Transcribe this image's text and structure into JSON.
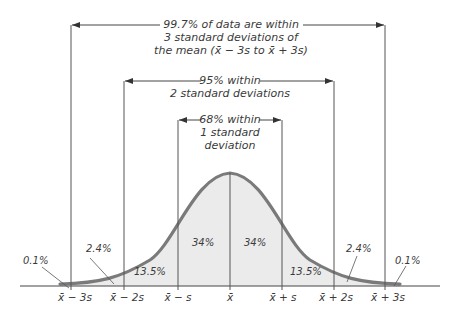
{
  "diagram": {
    "type": "normal-distribution-empirical-rule",
    "colors": {
      "curve": "#7a7a7a",
      "fill": "#ebebeb",
      "lines": "#555555",
      "text": "#3a3a3a"
    },
    "brackets": {
      "three_sd": {
        "line1": "99.7% of data are within",
        "line2": "3 standard deviations of",
        "line3": "the mean (x̄ − 3s to x̄ + 3s)"
      },
      "two_sd": {
        "line1": "95% within",
        "line2": "2 standard deviations"
      },
      "one_sd": {
        "line1": "68% within",
        "line2": "1 standard",
        "line3": "deviation"
      }
    },
    "regions": {
      "left_tail": "0.1%",
      "left_2_3": "2.4%",
      "left_1_2": "13.5%",
      "left_0_1": "34%",
      "right_0_1": "34%",
      "right_1_2": "13.5%",
      "right_2_3": "2.4%",
      "right_tail": "0.1%"
    },
    "ticks": [
      "x̄ − 3s",
      "x̄ − 2s",
      "x̄ − s",
      "x̄",
      "x̄ + s",
      "x̄ + 2s",
      "x̄ + 3s"
    ]
  }
}
